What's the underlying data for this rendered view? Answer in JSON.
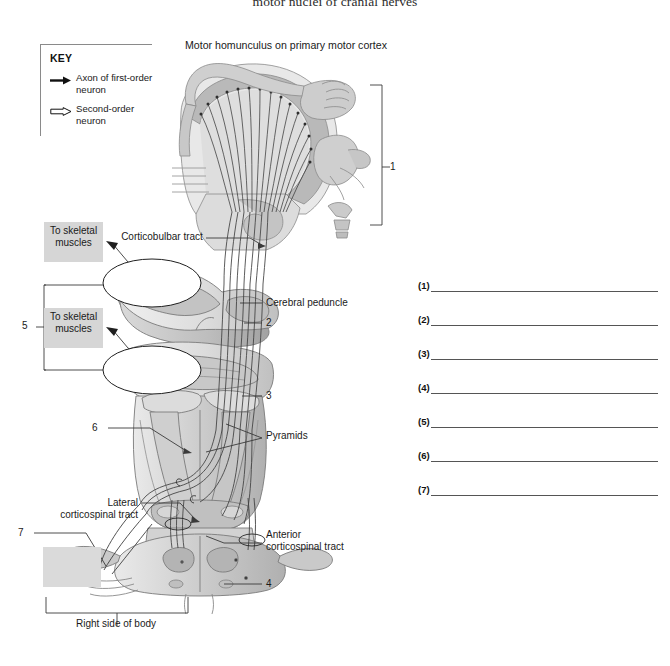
{
  "page": {
    "top_title": "motor nuclei of cranial nerves",
    "figure_title": "Motor homunculus on primary motor cortex"
  },
  "key": {
    "title": "KEY",
    "items": [
      {
        "label": "Axon of first-order neuron",
        "icon": "solid-arrow-icon"
      },
      {
        "label": "Second-order neuron",
        "icon": "open-arrow-icon"
      }
    ]
  },
  "diagram": {
    "chips": [
      {
        "id": "to-skeletal-muscles-1",
        "text": "To skeletal muscles"
      },
      {
        "id": "to-skeletal-muscles-2",
        "text": "To skeletal muscles"
      },
      {
        "id": "blank-answer-box-7",
        "text": ""
      }
    ],
    "labels": {
      "corticobulbar_tract": "Corticobulbar tract",
      "cerebral_peduncle": "Cerebral peduncle",
      "pyramids": "Pyramids",
      "lateral_corticospinal_tract": "Lateral corticospinal tract",
      "anterior_corticospinal_tract": "Anterior corticospinal tract",
      "right_side_of_body": "Right side of body"
    },
    "numbered_callouts": {
      "n1": "1",
      "n2": "2",
      "n3": "3",
      "n4": "4",
      "n5": "5",
      "n6": "6",
      "n7": "7"
    }
  },
  "answers": {
    "rows": [
      {
        "num": "(1)",
        "value": ""
      },
      {
        "num": "(2)",
        "value": ""
      },
      {
        "num": "(3)",
        "value": ""
      },
      {
        "num": "(4)",
        "value": ""
      },
      {
        "num": "(5)",
        "value": ""
      },
      {
        "num": "(6)",
        "value": ""
      },
      {
        "num": "(7)",
        "value": ""
      }
    ]
  },
  "colors": {
    "chip_gray": "#d6d6d6",
    "line_gray": "#555555",
    "anatomy_light": "#dedede",
    "anatomy_mid": "#bfbfbf",
    "anatomy_dark": "#9a9a9a",
    "outline": "#6f6f6f"
  }
}
